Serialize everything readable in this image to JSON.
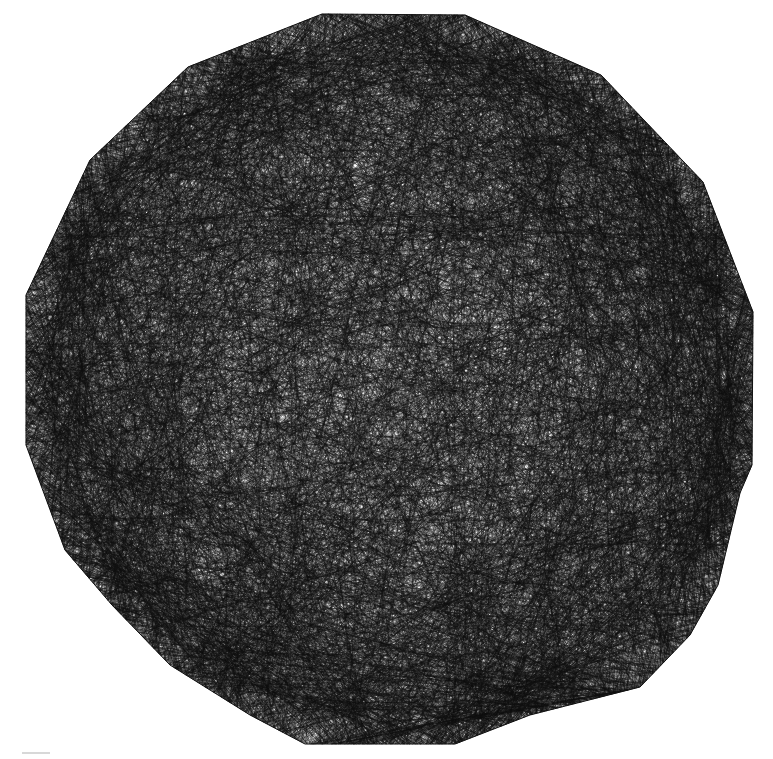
{
  "figure": {
    "background_color": "#ffffff",
    "stroke_color": "#111111",
    "stroke_width": 0.55,
    "stroke_opacity": 0.55,
    "chord_count": 5200,
    "seed": 1729,
    "polygon_vertices": [
      [
        322,
        14
      ],
      [
        465,
        15
      ],
      [
        601,
        75
      ],
      [
        703,
        182
      ],
      [
        753,
        312
      ],
      [
        752,
        465
      ],
      [
        740,
        493
      ],
      [
        718,
        585
      ],
      [
        690,
        635
      ],
      [
        640,
        687
      ],
      [
        530,
        715
      ],
      [
        455,
        744
      ],
      [
        305,
        744
      ],
      [
        250,
        715
      ],
      [
        170,
        665
      ],
      [
        112,
        605
      ],
      [
        65,
        550
      ],
      [
        26,
        445
      ],
      [
        26,
        295
      ],
      [
        90,
        160
      ],
      [
        188,
        67
      ]
    ]
  }
}
